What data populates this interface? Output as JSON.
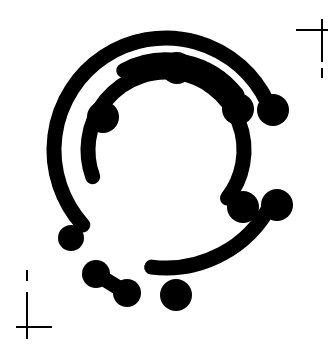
{
  "canvas": {
    "width": 332,
    "height": 359,
    "background_color": "#ffffff",
    "ink_color": "#000000"
  },
  "artwork": {
    "title": "Stylized letter C logo mark",
    "description": "Black monogram of the letter C built from concentric arc strokes with round ball terminals, framed by printer registration crop marks",
    "type": "monogram-logo",
    "letter": "C"
  },
  "strokes": [
    {
      "name": "outer-c-arc",
      "kind": "arc",
      "center_x": 166,
      "center_y": 150,
      "radius": 112,
      "start_angle_deg": 138,
      "end_angle_deg": 335,
      "sweep_deg": 197,
      "stroke_width": 15,
      "cap": "round",
      "color": "#000000"
    },
    {
      "name": "inner-c-arc",
      "kind": "arc",
      "center_x": 166,
      "center_y": 150,
      "radius": 78,
      "start_angle_deg": 160,
      "end_angle_deg": 398,
      "sweep_deg": 238,
      "stroke_width": 15,
      "cap": "round",
      "color": "#000000"
    },
    {
      "name": "upper-right-inner-arc",
      "kind": "arc",
      "center_x": 166,
      "center_y": 150,
      "radius": 90,
      "start_angle_deg": 242,
      "end_angle_deg": 322,
      "sweep_deg": 80,
      "stroke_width": 15,
      "cap": "round",
      "color": "#000000"
    },
    {
      "name": "lower-right-outer-arc",
      "kind": "arc",
      "center_x": 166,
      "center_y": 150,
      "radius": 118,
      "start_angle_deg": 27,
      "end_angle_deg": 97,
      "sweep_deg": 70,
      "stroke_width": 15,
      "cap": "round",
      "color": "#000000"
    },
    {
      "name": "short-dumbbell-segment",
      "kind": "line",
      "x1": 96,
      "y1": 274,
      "x2": 127,
      "y2": 293,
      "stroke_width": 15,
      "cap": "round",
      "color": "#000000"
    }
  ],
  "terminals": [
    {
      "name": "outer-arc-bottom-left-ball",
      "cx": 71,
      "cy": 238,
      "r": 13
    },
    {
      "name": "outer-arc-right-ball",
      "cx": 273,
      "cy": 110,
      "r": 16
    },
    {
      "name": "upper-inner-arc-left-ball",
      "cx": 177,
      "cy": 68,
      "r": 16
    },
    {
      "name": "upper-inner-arc-right-ball",
      "cx": 238,
      "cy": 109,
      "r": 16
    },
    {
      "name": "inner-c-arc-top-left-ball",
      "cx": 103,
      "cy": 117,
      "r": 16
    },
    {
      "name": "inner-c-arc-right-ball",
      "cx": 243,
      "cy": 207,
      "r": 16
    },
    {
      "name": "lower-outer-arc-top-ball",
      "cx": 277,
      "cy": 205,
      "r": 16
    },
    {
      "name": "lower-outer-arc-left-ball",
      "cx": 176,
      "cy": 295,
      "r": 16
    },
    {
      "name": "dumbbell-left-ball",
      "cx": 96,
      "cy": 274,
      "r": 14
    },
    {
      "name": "dumbbell-right-ball",
      "cx": 127,
      "cy": 293,
      "r": 14
    }
  ],
  "crop_marks": {
    "top_right": {
      "name": "top-right-crop-mark",
      "horizontal": {
        "x1": 296,
        "y1": 30,
        "x2": 328,
        "y2": 30
      },
      "vertical_main": {
        "x1": 322,
        "y1": 19,
        "x2": 322,
        "y2": 62
      },
      "vertical_dash": {
        "x1": 322,
        "y1": 68,
        "x2": 322,
        "y2": 78
      },
      "line_width": 2
    },
    "bottom_left": {
      "name": "bottom-left-crop-mark",
      "horizontal": {
        "x1": 16,
        "y1": 327,
        "x2": 52,
        "y2": 327
      },
      "vertical_main": {
        "x1": 27,
        "y1": 292,
        "x2": 27,
        "y2": 339
      },
      "vertical_dash": {
        "x1": 27,
        "y1": 270,
        "x2": 27,
        "y2": 281
      },
      "line_width": 2
    }
  }
}
